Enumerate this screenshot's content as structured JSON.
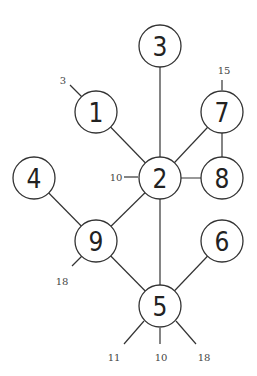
{
  "diagram": {
    "type": "graph",
    "nodes": [
      {
        "id": "1",
        "label": "1",
        "x": 96,
        "y": 112
      },
      {
        "id": "2",
        "label": "2",
        "x": 160,
        "y": 178
      },
      {
        "id": "3",
        "label": "3",
        "x": 160,
        "y": 46
      },
      {
        "id": "4",
        "label": "4",
        "x": 34,
        "y": 178
      },
      {
        "id": "5",
        "label": "5",
        "x": 160,
        "y": 306
      },
      {
        "id": "6",
        "label": "6",
        "x": 222,
        "y": 241
      },
      {
        "id": "7",
        "label": "7",
        "x": 222,
        "y": 112
      },
      {
        "id": "8",
        "label": "8",
        "x": 222,
        "y": 178
      },
      {
        "id": "9",
        "label": "9",
        "x": 96,
        "y": 241
      }
    ],
    "edges": [
      {
        "from": "1",
        "to": "2"
      },
      {
        "from": "3",
        "to": "2"
      },
      {
        "from": "7",
        "to": "2"
      },
      {
        "from": "7",
        "to": "8"
      },
      {
        "from": "2",
        "to": "8"
      },
      {
        "from": "2",
        "to": "9"
      },
      {
        "from": "2",
        "to": "5"
      },
      {
        "from": "4",
        "to": "9"
      },
      {
        "from": "9",
        "to": "5"
      },
      {
        "from": "6",
        "to": "5"
      }
    ],
    "stubs": [
      {
        "node": "1",
        "label": "3",
        "x1": 82,
        "y1": 97,
        "x2": 70,
        "y2": 85,
        "lx": 63,
        "ly": 80
      },
      {
        "node": "7",
        "label": "15",
        "x1": 222,
        "y1": 90,
        "x2": 222,
        "y2": 80,
        "lx": 224,
        "ly": 70
      },
      {
        "node": "2",
        "label": "10",
        "x1": 138,
        "y1": 177,
        "x2": 124,
        "y2": 177,
        "lx": 116,
        "ly": 177
      },
      {
        "node": "9",
        "label": "18",
        "x1": 82,
        "y1": 256,
        "x2": 72,
        "y2": 266,
        "lx": 62,
        "ly": 281
      },
      {
        "node": "5",
        "label": "11",
        "x1": 144,
        "y1": 321,
        "x2": 124,
        "y2": 344,
        "lx": 114,
        "ly": 357
      },
      {
        "node": "5",
        "label": "10",
        "x1": 160,
        "y1": 328,
        "x2": 160,
        "y2": 344,
        "lx": 161,
        "ly": 357
      },
      {
        "node": "5",
        "label": "18",
        "x1": 176,
        "y1": 321,
        "x2": 196,
        "y2": 344,
        "lx": 204,
        "ly": 357
      }
    ],
    "node_radius": 21,
    "colors": {
      "stroke": "#333333",
      "fill": "#ffffff",
      "text": "#222222"
    }
  }
}
